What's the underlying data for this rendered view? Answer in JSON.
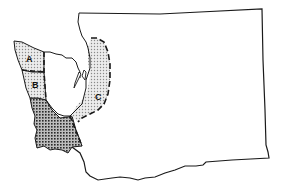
{
  "map": {
    "subject": "Washington State outline",
    "regions": [
      {
        "id": "A",
        "label": "A",
        "pattern": "light-stipple"
      },
      {
        "id": "B",
        "label": "B",
        "pattern": "light-stipple"
      },
      {
        "id": "C",
        "label": "C",
        "pattern": "light-stipple"
      },
      {
        "id": "D",
        "label": "",
        "pattern": "dense-crosshatch"
      }
    ],
    "colors": {
      "outline": "#1a1a1a",
      "light_fill": "#d6d6d6",
      "dense_fill": "#8a8a8a",
      "background": "#ffffff"
    }
  }
}
